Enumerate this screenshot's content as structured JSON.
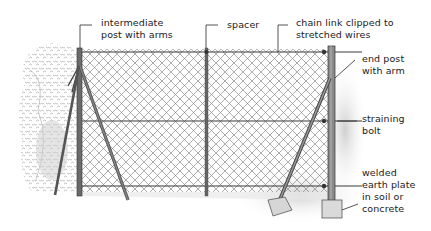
{
  "diagram": {
    "type": "chain-link fence construction illustration",
    "labels": {
      "intermediate_post": "intermediate\npost with arms",
      "spacer": "spacer",
      "chain_link": "chain link clipped to\nstretched wires",
      "end_post": "end post\nwith arm",
      "straining_bolt": "straining\nbolt",
      "earth_plate": "welded\nearth plate\nin soil or\nconcrete"
    },
    "colors": {
      "ink": "#2a2a2a",
      "mesh": "#777777",
      "post": "#555555",
      "foliage": "#8a8a8a",
      "background": "#ffffff"
    }
  }
}
